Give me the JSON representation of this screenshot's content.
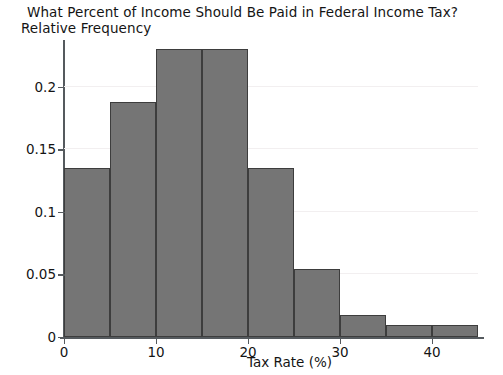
{
  "chart_data": {
    "type": "bar",
    "title": "What Percent of Income Should Be Paid in Federal Income Tax?",
    "subtitle": "Relative Frequency",
    "xlabel": "Tax Rate (%)",
    "ylabel": "Relative Frequency",
    "categories": [
      "0-5",
      "5-10",
      "10-15",
      "15-20",
      "20-25",
      "25-30",
      "30-35",
      "35-40",
      "40-45"
    ],
    "bin_edges": [
      0,
      5,
      10,
      15,
      20,
      25,
      30,
      35,
      40,
      45
    ],
    "values": [
      0.135,
      0.188,
      0.23,
      0.23,
      0.135,
      0.054,
      0.018,
      0.01,
      0.01
    ],
    "xlim": [
      0,
      45
    ],
    "ylim": [
      0,
      0.2375
    ],
    "xticks": [
      0,
      10,
      20,
      30,
      40
    ],
    "xtick_labels": [
      "0",
      "10",
      "20",
      "30",
      "40"
    ],
    "yticks": [
      0,
      0.05,
      0.1,
      0.15,
      0.2
    ],
    "ytick_labels": [
      "0",
      "0.05",
      "0.1",
      "0.15",
      "0.2"
    ],
    "grid": true,
    "legend": null,
    "bar_color": "#757575",
    "bar_edge_color": "#3d3d3d",
    "axis_color": "#555a5e",
    "grid_color": "#f2eff0",
    "background": "#ffffff"
  }
}
